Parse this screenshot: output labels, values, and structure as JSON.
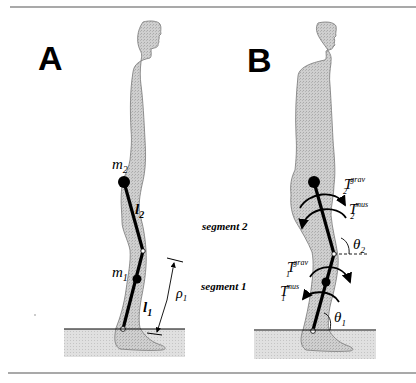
{
  "figure": {
    "panels": [
      {
        "id": "A",
        "label": "A",
        "masses": {
          "upper": "m",
          "upper_sub": "2",
          "lower": "m",
          "lower_sub": "1"
        },
        "lengths": {
          "upper": "l",
          "upper_sub": "2",
          "lower": "l",
          "lower_sub": "1"
        },
        "distance": {
          "symbol": "ρ",
          "sub": "1"
        }
      },
      {
        "id": "B",
        "label": "B",
        "torques": [
          {
            "symbol": "T",
            "sub": "2",
            "sup": "grav"
          },
          {
            "symbol": "T",
            "sub": "2",
            "sup": "mus"
          },
          {
            "symbol": "T",
            "sub": "1",
            "sup": "grav"
          },
          {
            "symbol": "T",
            "sub": "1",
            "sup": "mus"
          }
        ],
        "angles": [
          {
            "symbol": "θ",
            "sub": "2"
          },
          {
            "symbol": "θ",
            "sub": "1"
          }
        ]
      }
    ],
    "segment_labels": [
      "segment 2",
      "segment 1"
    ],
    "colors": {
      "silhouette": "#c8c8c8",
      "ground": "#dcdcdc",
      "line": "#000000",
      "rule": "#555555"
    }
  }
}
